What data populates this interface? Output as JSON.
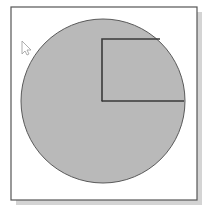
{
  "diagram": {
    "colors": {
      "background": "#ffffff",
      "frame_border": "#555555",
      "frame_shadow": "#d4d4d4",
      "circle_fill": "#b9b9b9",
      "circle_stroke": "#5a5a5a",
      "square_stroke": "#3a3a3a",
      "cursor_fill": "#ffffff",
      "cursor_stroke": "#9a9a9a"
    },
    "shapes": [
      {
        "id": "circle",
        "kind": "circle",
        "filled": true
      },
      {
        "id": "quarter-square",
        "kind": "rectangle-outline",
        "anchored_at": "circle-center",
        "extends": "up-right",
        "side_equals": "radius"
      }
    ],
    "cursor": {
      "icon": "arrow-pointer-icon",
      "visible": true
    }
  }
}
